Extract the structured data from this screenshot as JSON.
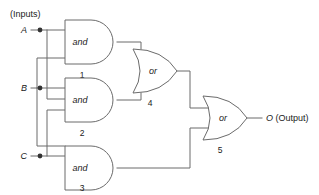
{
  "diagram": {
    "title_caption": "(Inputs)",
    "type": "logic-circuit",
    "inputs": [
      {
        "id": "A",
        "label": "A",
        "y": 30
      },
      {
        "id": "B",
        "label": "B",
        "y": 88
      },
      {
        "id": "C",
        "label": "C",
        "y": 156
      }
    ],
    "gates": [
      {
        "id": "g1",
        "kind": "and",
        "label": "and",
        "number": "1",
        "x": 65,
        "y": 42,
        "w": 52,
        "h": 44
      },
      {
        "id": "g2",
        "kind": "and",
        "label": "and",
        "number": "2",
        "x": 65,
        "y": 100,
        "w": 52,
        "h": 44
      },
      {
        "id": "g3",
        "kind": "and",
        "label": "and",
        "number": "3",
        "x": 65,
        "y": 168,
        "w": 52,
        "h": 44
      },
      {
        "id": "g4",
        "kind": "or",
        "label": "or",
        "number": "4",
        "x": 133,
        "y": 71,
        "w": 44,
        "h": 44
      },
      {
        "id": "g5",
        "kind": "or",
        "label": "or",
        "number": "5",
        "x": 203,
        "y": 127,
        "w": 44,
        "h": 44
      }
    ],
    "output": {
      "id": "O",
      "label": "O (Output)",
      "symbol": "O",
      "suffix": " (Output)",
      "y": 118
    },
    "connections": [
      {
        "from": "A",
        "to": "g1.in1"
      },
      {
        "from": "A",
        "to": "g2.in1"
      },
      {
        "from": "B",
        "to": "g2.in2"
      },
      {
        "from": "B",
        "to": "g1.in2"
      },
      {
        "from": "C",
        "to": "g3.in2"
      },
      {
        "from": "B",
        "to": "g3.in1"
      },
      {
        "from": "g1.out",
        "to": "g4.in1"
      },
      {
        "from": "g2.out",
        "to": "g4.in2"
      },
      {
        "from": "g4.out",
        "to": "g5.in1"
      },
      {
        "from": "g3.out",
        "to": "g5.in2"
      },
      {
        "from": "g5.out",
        "to": "O"
      }
    ],
    "colors": {
      "wire": "#6b6b6b",
      "text": "#1b1b1b",
      "background": "#ffffff",
      "junction": "#333333"
    }
  }
}
